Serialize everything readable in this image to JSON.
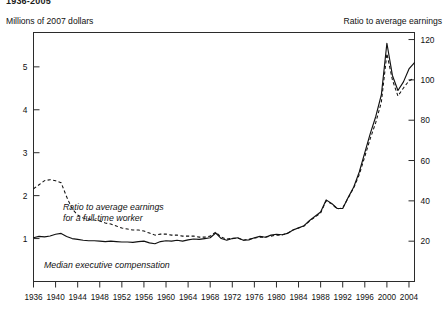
{
  "figure": {
    "title": "1936-2005",
    "left_axis_title": "Millions of 2007 dollars",
    "right_axis_title": "Ratio to average earnings"
  },
  "annotations": {
    "dashed_line_1": "Ratio to average earnings",
    "dashed_line_2": "for a full-time worker",
    "solid_line": "Median executive compensation"
  },
  "chart_data": {
    "type": "line",
    "title": "1936-2005",
    "xlabel": "",
    "ylabel": "Millions of 2007 dollars",
    "y2label": "Ratio to average earnings",
    "xlim": [
      1936,
      2005
    ],
    "ylim": [
      0,
      5.8
    ],
    "y2lim": [
      0,
      123.5
    ],
    "grid": false,
    "legend": "inline-annotations",
    "yticks": [
      1,
      2,
      3,
      4,
      5
    ],
    "y2ticks": [
      20,
      40,
      60,
      80,
      100,
      120
    ],
    "xticks": [
      1936,
      1940,
      1944,
      1948,
      1952,
      1956,
      1960,
      1964,
      1968,
      1972,
      1976,
      1980,
      1984,
      1988,
      1992,
      1996,
      2000,
      2004
    ],
    "x": [
      1936,
      1937,
      1938,
      1939,
      1940,
      1941,
      1942,
      1943,
      1944,
      1945,
      1946,
      1947,
      1948,
      1949,
      1950,
      1951,
      1952,
      1953,
      1954,
      1955,
      1956,
      1957,
      1958,
      1959,
      1960,
      1961,
      1962,
      1963,
      1964,
      1965,
      1966,
      1967,
      1968,
      1969,
      1970,
      1971,
      1972,
      1973,
      1974,
      1975,
      1976,
      1977,
      1978,
      1979,
      1980,
      1981,
      1982,
      1983,
      1984,
      1985,
      1986,
      1987,
      1988,
      1989,
      1990,
      1991,
      1992,
      1993,
      1994,
      1995,
      1996,
      1997,
      1998,
      1999,
      2000,
      2001,
      2002,
      2003,
      2004,
      2005
    ],
    "series": [
      {
        "name": "Median executive compensation",
        "style": "solid",
        "axis": "left",
        "units": "Millions of 2007 dollars",
        "values": [
          1.02,
          1.05,
          1.04,
          1.06,
          1.1,
          1.12,
          1.05,
          1.0,
          0.98,
          0.96,
          0.95,
          0.95,
          0.94,
          0.93,
          0.94,
          0.93,
          0.92,
          0.92,
          0.91,
          0.93,
          0.94,
          0.9,
          0.88,
          0.93,
          0.95,
          0.94,
          0.96,
          0.94,
          0.97,
          0.99,
          0.98,
          1.0,
          1.02,
          1.13,
          1.0,
          0.96,
          1.0,
          1.02,
          0.96,
          0.97,
          1.02,
          1.05,
          1.03,
          1.08,
          1.1,
          1.09,
          1.12,
          1.2,
          1.25,
          1.3,
          1.42,
          1.52,
          1.62,
          1.9,
          1.82,
          1.7,
          1.7,
          1.96,
          2.2,
          2.55,
          3.0,
          3.45,
          3.85,
          4.35,
          5.55,
          4.8,
          4.45,
          4.65,
          4.95,
          5.1
        ]
      },
      {
        "name": "Ratio to average earnings for a full-time worker",
        "style": "dashed",
        "axis": "right",
        "units": "Ratio to average earnings",
        "values": [
          46.0,
          48.0,
          50.0,
          50.5,
          50.0,
          49.0,
          42.0,
          36.0,
          33.0,
          31.5,
          31.0,
          30.5,
          30.0,
          29.0,
          28.5,
          27.5,
          26.5,
          26.0,
          25.5,
          25.5,
          25.0,
          24.0,
          23.0,
          23.5,
          23.5,
          23.0,
          23.0,
          22.5,
          22.5,
          22.5,
          22.0,
          22.0,
          22.5,
          24.5,
          22.0,
          21.0,
          21.5,
          21.5,
          20.5,
          21.0,
          21.5,
          22.0,
          22.0,
          22.5,
          23.0,
          23.0,
          24.0,
          25.5,
          26.5,
          27.5,
          30.0,
          32.0,
          34.0,
          40.0,
          38.5,
          36.0,
          36.5,
          41.5,
          46.5,
          53.0,
          62.0,
          71.0,
          79.0,
          89.0,
          113.0,
          100.0,
          92.0,
          96.0,
          99.5,
          101.0
        ]
      }
    ]
  }
}
